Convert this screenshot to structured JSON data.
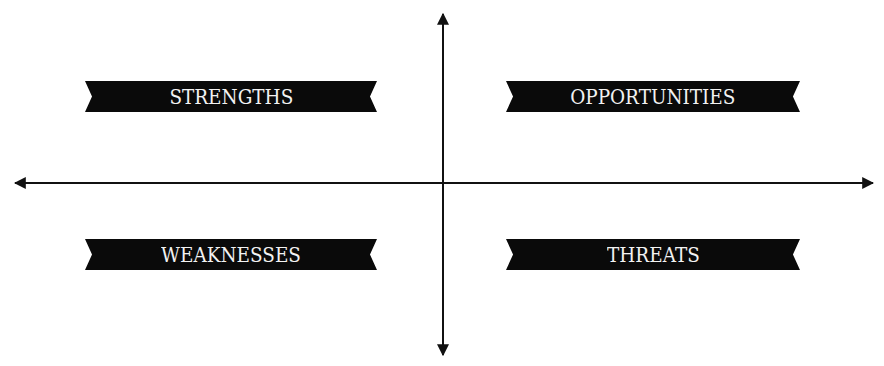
{
  "diagram": {
    "type": "swot-quadrant",
    "colors": {
      "banner_bg": "#0a0a0a",
      "banner_text": "#f2f2f2",
      "axis": "#111111",
      "background": "#ffffff"
    },
    "quadrants": [
      {
        "id": "strengths",
        "label": "STRENGTHS",
        "position": "top-left"
      },
      {
        "id": "opportunities",
        "label": "OPPORTUNITIES",
        "position": "top-right"
      },
      {
        "id": "weaknesses",
        "label": "WEAKNESSES",
        "position": "bottom-left"
      },
      {
        "id": "threats",
        "label": "THREATS",
        "position": "bottom-right"
      }
    ],
    "axes": {
      "horizontal": {
        "arrows": "both"
      },
      "vertical": {
        "arrows": "both"
      }
    }
  }
}
